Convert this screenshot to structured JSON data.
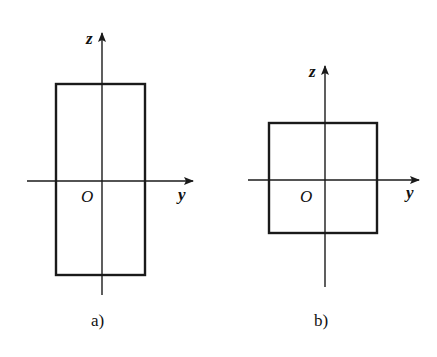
{
  "figures": [
    {
      "id": "a",
      "caption": "a)",
      "shape": "tall rectangle (h > b)",
      "rect": {
        "x": 56,
        "y": 84,
        "w": 89,
        "h": 191
      },
      "z_axis": {
        "x": 102,
        "y1": 295,
        "y2": 33,
        "label": "z"
      },
      "y_axis": {
        "y": 181,
        "x1": 27,
        "x2": 193,
        "label": "y"
      },
      "origin_label": "O"
    },
    {
      "id": "b",
      "caption": "b)",
      "shape": "square (h = b)",
      "rect": {
        "x": 269,
        "y": 123,
        "w": 108,
        "h": 110
      },
      "z_axis": {
        "x": 325,
        "y1": 287,
        "y2": 66,
        "label": "z"
      },
      "y_axis": {
        "y": 180,
        "x1": 248,
        "x2": 419,
        "label": "y"
      },
      "origin_label": "O"
    }
  ],
  "colors": {
    "stroke": "#1a1a1a",
    "background": "#ffffff"
  }
}
